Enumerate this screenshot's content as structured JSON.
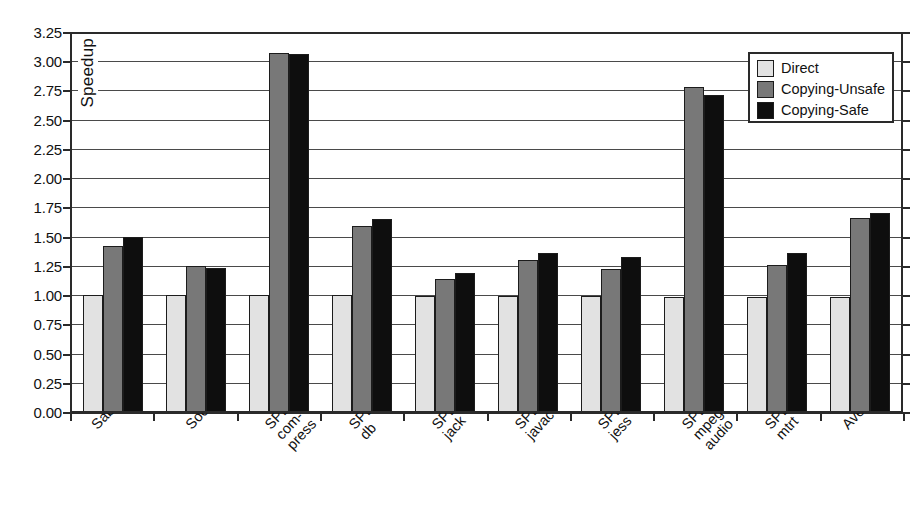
{
  "chart_data": {
    "type": "bar",
    "title": "",
    "xlabel": "",
    "ylabel": "Speedup",
    "ylim": [
      0.0,
      3.25
    ],
    "ytick_step": 0.25,
    "grid": true,
    "legend_position": "top-right",
    "ytick_labels": [
      "3.25",
      "3.00",
      "2.75",
      "2.50",
      "2.25",
      "2.00",
      "1.75",
      "1.50",
      "1.25",
      "1.00",
      "0.75",
      "0.50",
      "0.25",
      "0.00"
    ],
    "categories": [
      "SableCC",
      "Soot",
      "SPEC\ncom-\npress",
      "SPEC\ndb",
      "SPEC\njack",
      "SPEC\njavac",
      "SPEC\njess",
      "SPEC\nmpeg\naudio",
      "SPEC\nmtrt",
      "Average"
    ],
    "series": [
      {
        "name": "Direct",
        "color": "#e2e2e2",
        "values": [
          1.0,
          1.0,
          1.0,
          1.0,
          0.99,
          0.99,
          0.99,
          0.98,
          0.98,
          0.98
        ]
      },
      {
        "name": "Copying-Unsafe",
        "color": "#787878",
        "values": [
          1.42,
          1.25,
          3.07,
          1.59,
          1.14,
          1.3,
          1.22,
          2.78,
          1.26,
          1.66
        ]
      },
      {
        "name": "Copying-Safe",
        "color": "#0e0e0e",
        "values": [
          1.5,
          1.23,
          3.06,
          1.65,
          1.19,
          1.36,
          1.33,
          2.71,
          1.36,
          1.7
        ]
      }
    ]
  }
}
